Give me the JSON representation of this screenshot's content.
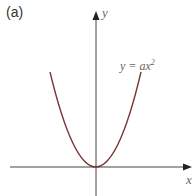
{
  "figure": {
    "panel_label": "(a)",
    "x_axis_label": "x",
    "y_axis_label": "y",
    "curve_label_main": "y = ax",
    "curve_label_exp": "2",
    "curve_color": "#7a3535",
    "axis_color": "#444444"
  }
}
